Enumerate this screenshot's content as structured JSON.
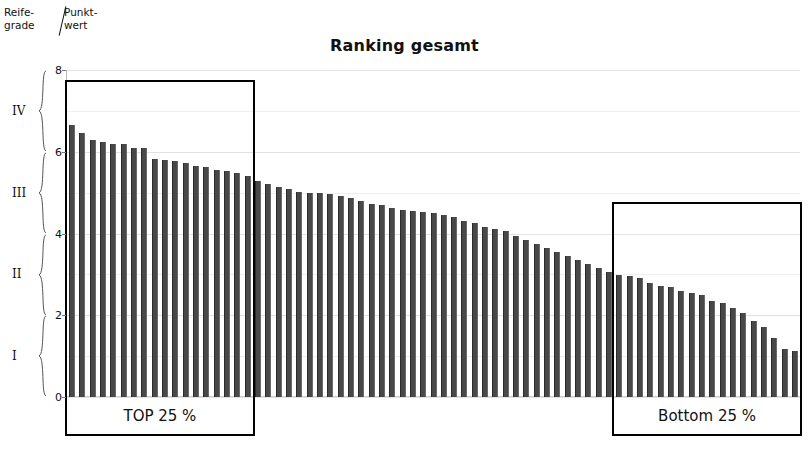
{
  "chart_data": {
    "type": "bar",
    "title": "Ranking gesamt",
    "xlabel": "",
    "ylabel": "Punktwert",
    "ylim": [
      0,
      8
    ],
    "yticks": [
      0,
      2,
      4,
      6,
      8
    ],
    "grid": true,
    "legend": "none",
    "categories": [
      "1",
      "2",
      "3",
      "4",
      "5",
      "6",
      "7",
      "8",
      "9",
      "10",
      "11",
      "12",
      "13",
      "14",
      "15",
      "16",
      "17",
      "18",
      "19",
      "20",
      "21",
      "22",
      "23",
      "24",
      "25",
      "26",
      "27",
      "28",
      "29",
      "30",
      "31",
      "32",
      "33",
      "34",
      "35",
      "36",
      "37",
      "38",
      "39",
      "40",
      "41",
      "42",
      "43",
      "44",
      "45",
      "46",
      "47",
      "48",
      "49",
      "50",
      "51",
      "52",
      "53",
      "54",
      "55",
      "56",
      "57",
      "58",
      "59",
      "60",
      "61",
      "62",
      "63",
      "64",
      "65",
      "66",
      "67",
      "68",
      "69",
      "70",
      "71"
    ],
    "values": [
      6.65,
      6.45,
      6.3,
      6.25,
      6.2,
      6.18,
      6.1,
      6.08,
      5.82,
      5.8,
      5.78,
      5.72,
      5.65,
      5.62,
      5.55,
      5.52,
      5.48,
      5.4,
      5.28,
      5.22,
      5.15,
      5.1,
      5.02,
      5.0,
      4.98,
      4.96,
      4.92,
      4.88,
      4.8,
      4.72,
      4.7,
      4.62,
      4.58,
      4.55,
      4.52,
      4.5,
      4.45,
      4.4,
      4.3,
      4.25,
      4.15,
      4.1,
      4.05,
      3.95,
      3.85,
      3.75,
      3.65,
      3.55,
      3.45,
      3.35,
      3.25,
      3.15,
      3.05,
      2.98,
      2.95,
      2.9,
      2.8,
      2.72,
      2.68,
      2.6,
      2.55,
      2.5,
      2.35,
      2.3,
      2.18,
      2.05,
      1.85,
      1.72,
      1.45,
      1.18,
      1.12
    ],
    "annotations": [
      {
        "name": "top-quartile",
        "label": "TOP 25 %",
        "start_index": 0,
        "end_index": 17
      },
      {
        "name": "bottom-quartile",
        "label": "Bottom 25 %",
        "start_index": 53,
        "end_index": 70
      }
    ],
    "maturity_grades": [
      {
        "label": "IV",
        "from": 6,
        "to": 8
      },
      {
        "label": "III",
        "from": 4,
        "to": 6
      },
      {
        "label": "II",
        "from": 2,
        "to": 4
      },
      {
        "label": "I",
        "from": 0,
        "to": 2
      }
    ],
    "bar_color": "#484848"
  },
  "axis_captions": {
    "left": "Reife-\ngrade",
    "right": "Punkt-\nwert"
  },
  "colors": {
    "bar": "#484848",
    "box_border": "#000000",
    "gridline": "#e2e2e2",
    "text": "#111111"
  }
}
